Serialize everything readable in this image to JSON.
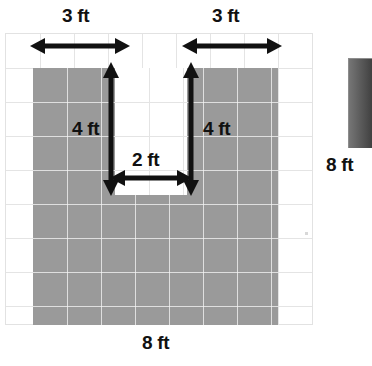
{
  "figure": {
    "kind": "area-grid-diagram",
    "cropped_heading_text": "Find the area.",
    "grid": {
      "columns": 9,
      "rows": 9,
      "cell_size_px": 34,
      "line_color": "#e4e4e4",
      "border_color": "#e2e2e2"
    },
    "shape": {
      "fill_color": "#9a9a9a",
      "overall_width_ft": 8,
      "overall_height_ft": 8,
      "notch_width_ft": 2,
      "notch_depth_ft": 4,
      "left_arm_width_ft": 3,
      "right_arm_width_ft": 3,
      "notch_fill_color": "#ffffff"
    },
    "edge_bar_color": "#4f4f4f"
  },
  "labels": {
    "top_left_width": "3 ft",
    "top_right_width": "3 ft",
    "left_arm_height": "4 ft",
    "right_arm_height": "4 ft",
    "notch_width": "2 ft",
    "right_side_height": "8 ft",
    "bottom_width": "8 ft"
  },
  "icons": {
    "horizontal_double_arrow": "double-arrow-horizontal-icon",
    "vertical_double_arrow": "double-arrow-vertical-icon"
  },
  "chart_data": {
    "type": "table",
    "categories": [
      "overall width",
      "overall height",
      "left arm width",
      "right arm width",
      "notch width",
      "notch depth",
      "left arm height",
      "right arm height"
    ],
    "values": [
      8,
      8,
      3,
      3,
      2,
      4,
      4,
      4
    ],
    "units": "ft",
    "xlabel": "dimension",
    "ylabel": "length (ft)",
    "annotations": [
      "3 ft",
      "3 ft",
      "4 ft",
      "4 ft",
      "2 ft",
      "8 ft",
      "8 ft"
    ]
  }
}
